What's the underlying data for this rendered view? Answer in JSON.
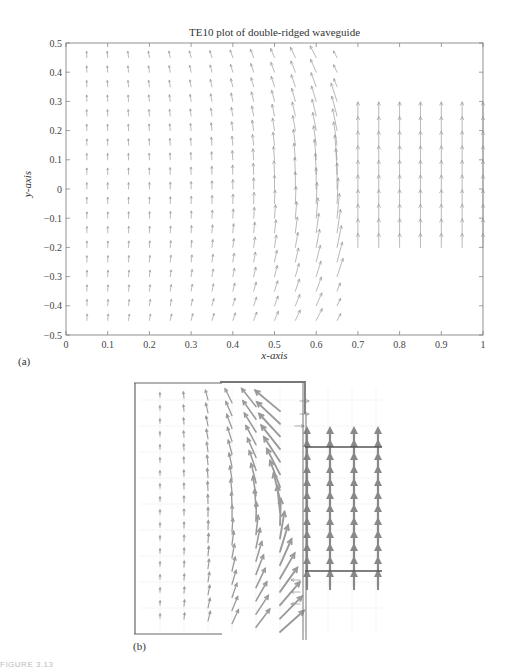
{
  "figure": {
    "caption_fragment": "FIGURE 3.13",
    "panel_a_label": "(a)",
    "panel_b_label": "(b)"
  },
  "chart_data": [
    {
      "type": "quiver",
      "title": "TE10 plot of double-ridged waveguide",
      "xlabel": "x-axis",
      "ylabel": "y-axis",
      "xlim": [
        0,
        1
      ],
      "ylim": [
        -0.5,
        0.5
      ],
      "xticks": [
        "0",
        "0.1",
        "0.2",
        "0.3",
        "0.4",
        "0.5",
        "0.6",
        "0.7",
        "0.8",
        "0.9",
        "1"
      ],
      "yticks": [
        "0.5",
        "0.4",
        "0.3",
        "0.2",
        "0.1",
        "0",
        "-0.1",
        "-0.2",
        "-0.3",
        "-0.4",
        "-0.5"
      ],
      "grid": false,
      "legend": null,
      "field_regions": {
        "main_region": {
          "x_range": [
            0.05,
            0.65
          ],
          "y_range": [
            -0.45,
            0.45
          ],
          "spacing": 0.05,
          "pattern": "curved field circulating toward ridge edge at x≈0.65; vectors grow near ridge gap corner"
        },
        "gap_region": {
          "x_range": [
            0.7,
            1.0
          ],
          "y_range": [
            -0.2,
            0.25
          ],
          "spacing": 0.05,
          "pattern": "uniform vertical arrows pointing +y between ridges"
        }
      },
      "arrow_color": "#8a8a8a"
    },
    {
      "type": "quiver",
      "title": "",
      "description": "Zoomed/simulated field plot of ridged waveguide cross-section with ridge outline",
      "outline_color": "#666666",
      "arrow_color": "#8c8c8c",
      "field_regions": {
        "left_region": "curved arrows intensifying toward ridge edge",
        "gap_region": "thick uniform vertical arrows between ridge plates"
      }
    }
  ]
}
